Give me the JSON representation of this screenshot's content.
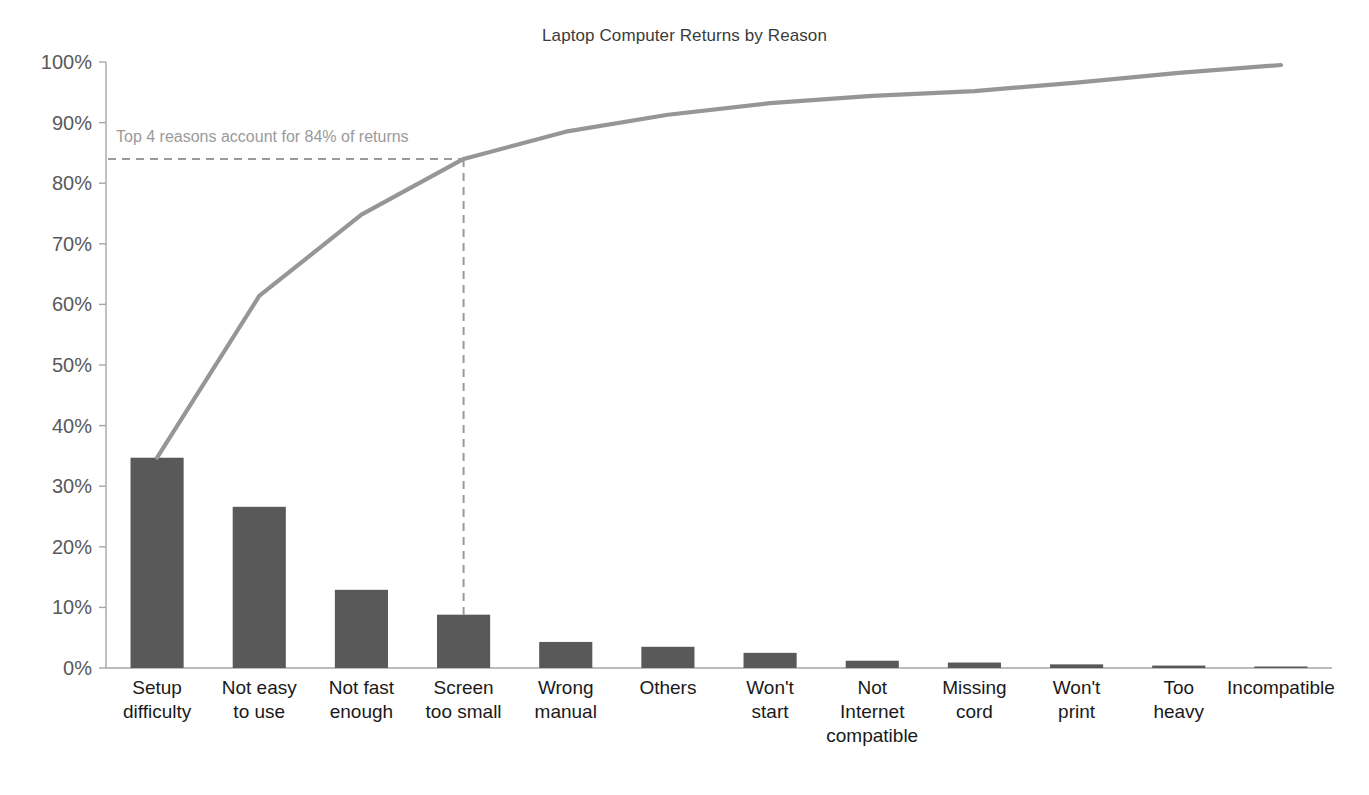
{
  "chart_data": {
    "type": "bar",
    "title": "Laptop Computer Returns by Reason",
    "xlabel": "",
    "ylabel": "",
    "ylim": [
      0,
      100
    ],
    "grid": false,
    "legend": "none",
    "categories": [
      "Setup difficulty",
      "Not easy to use",
      "Not fast enough",
      "Screen too small",
      "Wrong manual",
      "Others",
      "Won't start",
      "Not Internet compatible",
      "Missing cord",
      "Won't print",
      "Too heavy",
      "Incompatible"
    ],
    "category_lines": [
      [
        "Setup",
        "difficulty"
      ],
      [
        "Not easy",
        "to use"
      ],
      [
        "Not fast",
        "enough"
      ],
      [
        "Screen",
        "too small"
      ],
      [
        "Wrong",
        "manual"
      ],
      [
        "Others"
      ],
      [
        "Won't",
        "start"
      ],
      [
        "Not",
        "Internet",
        "compatible"
      ],
      [
        "Missing",
        "cord"
      ],
      [
        "Won't",
        "print"
      ],
      [
        "Too",
        "heavy"
      ],
      [
        "Incompatible"
      ]
    ],
    "series": [
      {
        "name": "Percent of returns",
        "type": "bar",
        "values": [
          34.7,
          26.6,
          12.9,
          8.8,
          4.3,
          3.5,
          2.5,
          1.2,
          0.9,
          0.6,
          0.4,
          0.2
        ]
      },
      {
        "name": "Cumulative percent",
        "type": "line",
        "values": [
          34.7,
          61.3,
          74.2,
          83.0,
          87.3,
          90.8,
          93.3,
          94.5,
          95.4,
          96.0,
          96.4,
          96.6
        ]
      }
    ],
    "cumulative_curve_points": [
      [
        34.7,
        61.4,
        74.8,
        84.0,
        88.5,
        91.3,
        93.2,
        94.4,
        95.2,
        96.6,
        98.2,
        99.5
      ]
    ],
    "ytick_labels": [
      "0%",
      "10%",
      "20%",
      "30%",
      "40%",
      "50%",
      "60%",
      "70%",
      "80%",
      "90%",
      "100%"
    ],
    "ytick_values": [
      0,
      10,
      20,
      30,
      40,
      50,
      60,
      70,
      80,
      90,
      100
    ],
    "annotation": {
      "text": "Top 4 reasons account for 84% of returns",
      "threshold_percent": 84,
      "highlight_category_index": 3
    },
    "colors": {
      "bar": "#595959",
      "line": "#969696",
      "annotation": "#9a9a9a",
      "axis": "#a6a6a6",
      "ytick_text": "#595959",
      "xtick_text": "#1a1a1a",
      "title_text": "#3b3b3b",
      "background": "#ffffff"
    }
  }
}
